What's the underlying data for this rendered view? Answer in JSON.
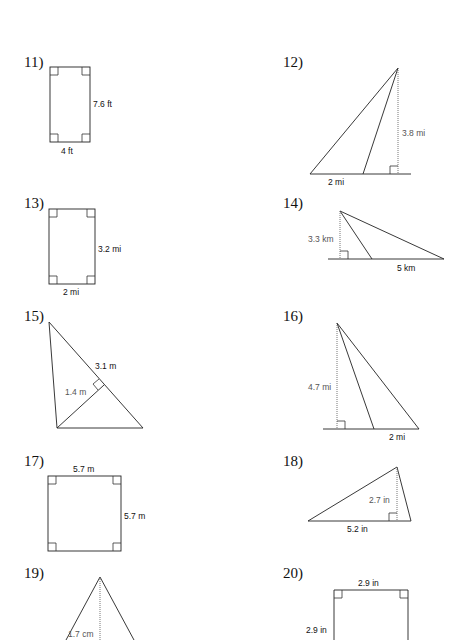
{
  "problems": [
    {
      "number": "11)",
      "shape": "rectangle",
      "labels": {
        "side": "7.6 ft",
        "base": "4 ft"
      }
    },
    {
      "number": "12)",
      "shape": "triangle",
      "labels": {
        "height": "3.8 mi",
        "base": "2 mi"
      }
    },
    {
      "number": "13)",
      "shape": "rectangle",
      "labels": {
        "side": "3.2 mi",
        "base": "2 mi"
      }
    },
    {
      "number": "14)",
      "shape": "triangle",
      "labels": {
        "height": "3.3 km",
        "base": "5 km"
      }
    },
    {
      "number": "15)",
      "shape": "triangle",
      "labels": {
        "base": "3.1 m",
        "height": "1.4 m"
      }
    },
    {
      "number": "16)",
      "shape": "triangle",
      "labels": {
        "height": "4.7 mi",
        "base": "2 mi"
      }
    },
    {
      "number": "17)",
      "shape": "square",
      "labels": {
        "top": "5.7 m",
        "side": "5.7 m"
      }
    },
    {
      "number": "18)",
      "shape": "triangle",
      "labels": {
        "height": "2.7 in",
        "base": "5.2 in"
      }
    },
    {
      "number": "19)",
      "shape": "triangle",
      "labels": {
        "height": "1.7 cm"
      }
    },
    {
      "number": "20)",
      "shape": "square",
      "labels": {
        "top": "2.9 in",
        "side": "2.9 in"
      }
    }
  ]
}
